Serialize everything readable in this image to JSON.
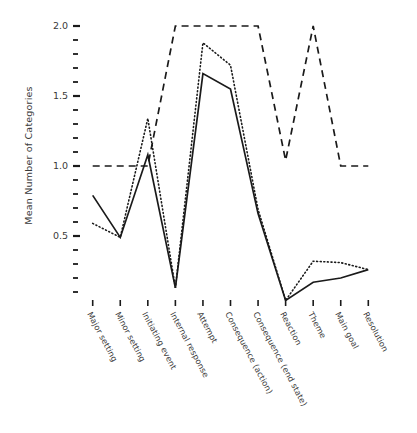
{
  "chart_data": {
    "type": "line",
    "title": "",
    "xlabel": "",
    "ylabel": "Mean Number of Categories",
    "categories": [
      "Major setting",
      "Minor setting",
      "Initiating event",
      "Internal response",
      "Attempt",
      "Consequence (action)",
      "Consequence (end state)",
      "Reaction",
      "Theme",
      "Main goal",
      "Resolution"
    ],
    "ylim": [
      0.0,
      2.05
    ],
    "xlim": [
      0,
      10
    ],
    "yticks_major": [
      0.5,
      1.0,
      1.5,
      2.0
    ],
    "ytick_labels": [
      "0.5",
      "1.0",
      "1.5",
      "2.0"
    ],
    "ytick_minor_step": 0.1,
    "grid": false,
    "legend": "none",
    "series": [
      {
        "name": "solid",
        "style": "solid",
        "color": "#1a1a1a",
        "values": [
          0.79,
          0.49,
          1.08,
          0.13,
          1.66,
          1.55,
          0.66,
          0.04,
          0.17,
          0.2,
          0.26
        ]
      },
      {
        "name": "dotted",
        "style": "dotted",
        "color": "#1a1a1a",
        "values": [
          0.59,
          0.49,
          1.34,
          0.13,
          1.88,
          1.72,
          0.69,
          0.04,
          0.32,
          0.31,
          0.26
        ]
      },
      {
        "name": "dashed",
        "style": "dashed",
        "color": "#1a1a1a",
        "values": [
          1.0,
          1.0,
          1.0,
          2.0,
          2.0,
          2.0,
          2.0,
          1.04,
          2.0,
          1.0,
          1.0
        ]
      }
    ]
  },
  "axis": {
    "y_title": "Mean Number of Categories",
    "y_labels": [
      "2.0",
      "1.5",
      "1.0",
      "0.5"
    ]
  }
}
